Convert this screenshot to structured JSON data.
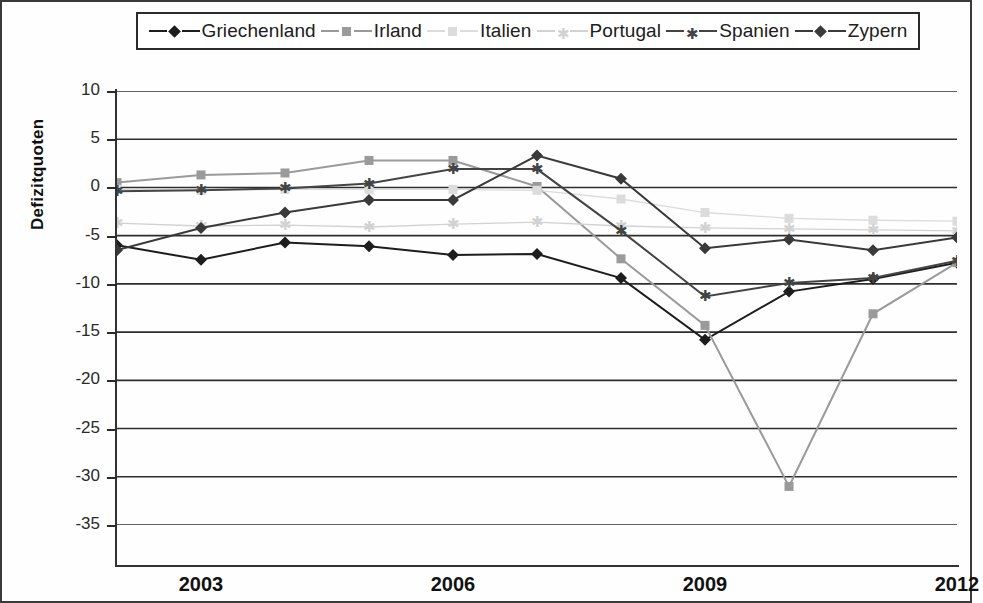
{
  "axis": {
    "ylabel": "Defizitquoten",
    "yticks": [
      "10",
      "5",
      "0",
      "-5",
      "-10",
      "-15",
      "-20",
      "-25",
      "-30",
      "-35"
    ],
    "xticks": [
      "2003",
      "2006",
      "2009",
      "2012"
    ]
  },
  "legend": {
    "items": [
      {
        "label": "Griechenland",
        "marker": "diamond",
        "color": "#1d1d1d",
        "line": true
      },
      {
        "label": "Irland",
        "marker": "square",
        "color": "#9a9a9a",
        "line": true
      },
      {
        "label": "Italien",
        "marker": "square",
        "color": "#dcdcdc",
        "line": true
      },
      {
        "label": "Portugal",
        "marker": "star",
        "color": "#d2d2d2",
        "line": true
      },
      {
        "label": "Spanien",
        "marker": "star",
        "color": "#444444",
        "line": true
      },
      {
        "label": "Zypern",
        "marker": "diamond",
        "color": "#3a3a3a",
        "line": true
      }
    ]
  },
  "chart_data": {
    "type": "line",
    "title": "",
    "xlabel": "",
    "ylabel": "Defizitquoten",
    "xlim": [
      2002,
      2012
    ],
    "ylim": [
      -35,
      10
    ],
    "ytick_step": 5,
    "grid": true,
    "legend_position": "top",
    "x": [
      2002,
      2003,
      2004,
      2005,
      2006,
      2007,
      2008,
      2009,
      2010,
      2011,
      2012
    ],
    "series": [
      {
        "name": "Griechenland",
        "color": "#1d1d1d",
        "marker": "diamond",
        "values": [
          -6.0,
          -7.5,
          -5.7,
          -6.1,
          -7.0,
          -6.9,
          -9.4,
          -15.8,
          -10.8,
          -9.5,
          -7.8
        ]
      },
      {
        "name": "Irland",
        "color": "#9a9a9a",
        "marker": "square",
        "values": [
          0.5,
          1.3,
          1.5,
          2.8,
          2.8,
          0.1,
          -7.4,
          -14.3,
          -31.0,
          -13.1,
          -7.8
        ]
      },
      {
        "name": "Italien",
        "color": "#dcdcdc",
        "marker": "square",
        "values": [
          -0.2,
          -0.3,
          -0.2,
          -0.2,
          -0.2,
          -0.3,
          -1.2,
          -2.6,
          -3.2,
          -3.4,
          -3.5
        ]
      },
      {
        "name": "Portugal",
        "color": "#d2d2d2",
        "marker": "star",
        "values": [
          -3.7,
          -4.0,
          -3.9,
          -4.1,
          -3.8,
          -3.6,
          -4.0,
          -4.2,
          -4.3,
          -4.4,
          -4.5
        ]
      },
      {
        "name": "Spanien",
        "color": "#444444",
        "marker": "star",
        "values": [
          -0.4,
          -0.3,
          -0.1,
          0.4,
          1.9,
          1.9,
          -4.5,
          -11.3,
          -9.9,
          -9.4,
          -7.6
        ]
      },
      {
        "name": "Zypern",
        "color": "#3a3a3a",
        "marker": "diamond",
        "values": [
          -6.5,
          -4.2,
          -2.6,
          -1.3,
          -1.3,
          3.3,
          0.9,
          -6.3,
          -5.4,
          -6.5,
          -5.2
        ]
      }
    ]
  }
}
